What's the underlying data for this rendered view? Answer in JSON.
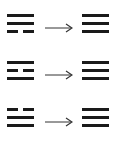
{
  "diagram": {
    "rows": [
      {
        "from": {
          "name": "Dui",
          "lines_top_to_bottom": [
            "solid",
            "solid",
            "broken"
          ]
        },
        "arrow": "→",
        "to": {
          "name": "Qian",
          "lines_top_to_bottom": [
            "solid",
            "solid",
            "solid"
          ]
        }
      },
      {
        "from": {
          "name": "Li",
          "lines_top_to_bottom": [
            "solid",
            "broken",
            "solid"
          ]
        },
        "arrow": "→",
        "to": {
          "name": "Qian",
          "lines_top_to_bottom": [
            "solid",
            "solid",
            "solid"
          ]
        }
      },
      {
        "from": {
          "name": "Xun",
          "lines_top_to_bottom": [
            "broken",
            "solid",
            "solid"
          ]
        },
        "arrow": "→",
        "to": {
          "name": "Qian",
          "lines_top_to_bottom": [
            "solid",
            "solid",
            "solid"
          ]
        }
      }
    ],
    "colors": {
      "line": "#1a1a1a",
      "background": "#ffffff"
    }
  }
}
